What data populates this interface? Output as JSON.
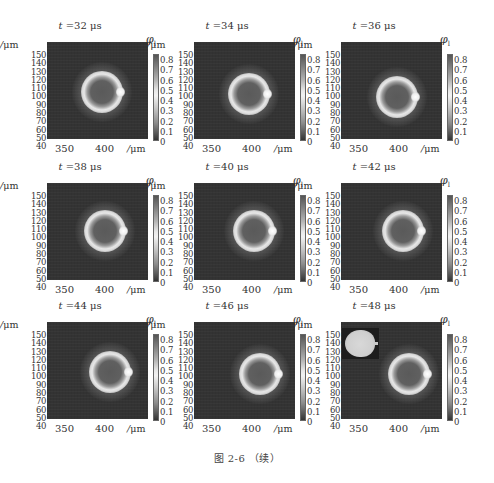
{
  "figure": {
    "caption": "图 2-6  （续）",
    "common": {
      "y_unit": "/μm",
      "x_unit": "/μm",
      "colorbar_symbol": "φ",
      "colorbar_subscript": "l",
      "y_ticks": [
        "150",
        "140",
        "130",
        "120",
        "110",
        "100",
        "90",
        "80",
        "70",
        "60",
        "50",
        "40"
      ],
      "x_ticks": [
        "350",
        "400"
      ],
      "colorbar_ticks": [
        "0.8",
        "0.7",
        "0.6",
        "0.5",
        "0.4",
        "0.3",
        "0.2",
        "0.1",
        "0"
      ]
    },
    "panels": [
      {
        "t_label": "t",
        "t_value": "=32 μs",
        "drop_x": 55,
        "drop_y": 50,
        "has_inset": false
      },
      {
        "t_label": "t",
        "t_value": "=34 μs",
        "drop_x": 55,
        "drop_y": 52,
        "has_inset": false
      },
      {
        "t_label": "t",
        "t_value": "=36 μs",
        "drop_x": 56,
        "drop_y": 55,
        "has_inset": false
      },
      {
        "t_label": "t",
        "t_value": "=38 μs",
        "drop_x": 58,
        "drop_y": 48,
        "has_inset": false
      },
      {
        "t_label": "t",
        "t_value": "=40 μs",
        "drop_x": 60,
        "drop_y": 48,
        "has_inset": false
      },
      {
        "t_label": "t",
        "t_value": "=42 μs",
        "drop_x": 62,
        "drop_y": 48,
        "has_inset": false
      },
      {
        "t_label": "t",
        "t_value": "=44 μs",
        "drop_x": 63,
        "drop_y": 50,
        "has_inset": false
      },
      {
        "t_label": "t",
        "t_value": "=46 μs",
        "drop_x": 66,
        "drop_y": 52,
        "has_inset": false
      },
      {
        "t_label": "t",
        "t_value": "=48 μs",
        "drop_x": 68,
        "drop_y": 52,
        "has_inset": true
      }
    ]
  },
  "chart_data": {
    "type": "heatmap",
    "title": "图 2-6 （续）",
    "subplots": [
      {
        "title": "t=32 μs"
      },
      {
        "title": "t=34 μs"
      },
      {
        "title": "t=36 μs"
      },
      {
        "title": "t=38 μs"
      },
      {
        "title": "t=40 μs"
      },
      {
        "title": "t=42 μs"
      },
      {
        "title": "t=44 μs"
      },
      {
        "title": "t=46 μs"
      },
      {
        "title": "t=48 μs",
        "inset": "droplet shape image (top-left)"
      }
    ],
    "xlabel": "/μm",
    "ylabel": "/μm",
    "x_tick_labels": [
      350,
      400
    ],
    "y_tick_labels": [
      150,
      140,
      130,
      120,
      110,
      100,
      90,
      80,
      70,
      60,
      50,
      40
    ],
    "colorbar": {
      "label": "φl",
      "range": [
        0,
        0.8
      ],
      "ticks": [
        0.8,
        0.7,
        0.6,
        0.5,
        0.4,
        0.3,
        0.2,
        0.1,
        0
      ]
    },
    "layout": {
      "rows": 3,
      "cols": 3,
      "grid": false
    }
  }
}
